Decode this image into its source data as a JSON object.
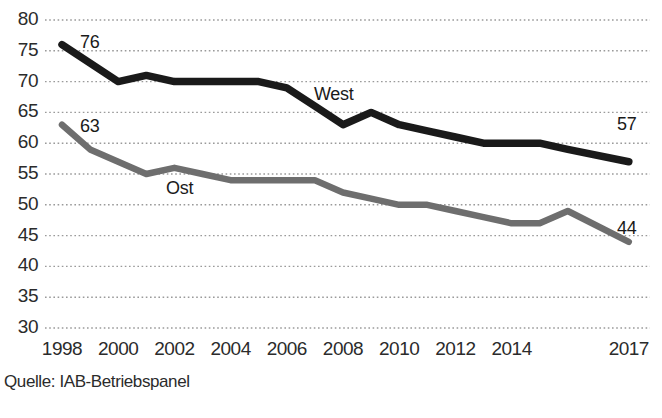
{
  "source_note": "Quelle: IAB-Betriebspanel",
  "colors": {
    "west_line": "#1a1a1a",
    "ost_line": "#6e6e6e",
    "gridline": "#9a9a9a",
    "axis_text": "#2b2b2b",
    "background": "#ffffff"
  },
  "labels": {
    "west": "West",
    "ost": "Ost",
    "west_first_value": "76",
    "west_last_value": "57",
    "ost_first_value": "63",
    "ost_last_value": "44"
  },
  "chart_data": {
    "type": "line",
    "title": "",
    "xlabel": "",
    "ylabel": "",
    "ylim": [
      30,
      80
    ],
    "ytick_labels": [
      "80",
      "75",
      "70",
      "65",
      "60",
      "55",
      "50",
      "45",
      "40",
      "35",
      "30"
    ],
    "ytick_values": [
      80,
      75,
      70,
      65,
      60,
      55,
      50,
      45,
      40,
      35,
      30
    ],
    "xtick_labels": [
      "1998",
      "2000",
      "2002",
      "2004",
      "2006",
      "2008",
      "2010",
      "2012",
      "2014",
      "2017"
    ],
    "xtick_values": [
      1998,
      2000,
      2002,
      2004,
      2006,
      2008,
      2010,
      2012,
      2014,
      2017
    ],
    "x": [
      1998,
      1999,
      2000,
      2001,
      2002,
      2003,
      2004,
      2005,
      2006,
      2007,
      2008,
      2009,
      2010,
      2011,
      2012,
      2013,
      2014,
      2015,
      2016,
      2017
    ],
    "grid": true,
    "legend": "inline-annotations",
    "series": [
      {
        "name": "West",
        "color": "#1a1a1a",
        "values": [
          76,
          73,
          70,
          71,
          70,
          70,
          70,
          70,
          69,
          66,
          63,
          65,
          63,
          62,
          61,
          60,
          60,
          60,
          59,
          57
        ],
        "first_label": "76",
        "last_label": "57"
      },
      {
        "name": "Ost",
        "color": "#6e6e6e",
        "values": [
          63,
          59,
          57,
          55,
          56,
          55,
          54,
          54,
          54,
          54,
          52,
          51,
          50,
          50,
          49,
          48,
          47,
          47,
          49,
          44
        ],
        "first_label": "63",
        "last_label": "44"
      }
    ]
  }
}
